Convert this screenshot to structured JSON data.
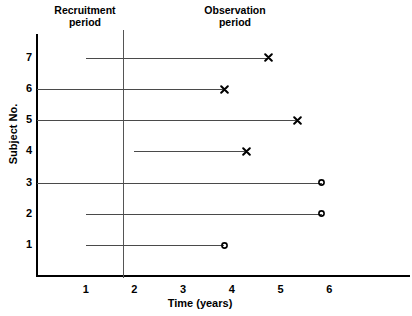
{
  "chart_data": {
    "type": "line",
    "title": "",
    "subtitle": "",
    "xlabel": "Time (years)",
    "ylabel": "Subject No.",
    "xlim": [
      0,
      7.6
    ],
    "ylim": [
      0,
      7.8
    ],
    "x_ticks": [
      "1",
      "2",
      "3",
      "4",
      "5",
      "6"
    ],
    "x_tick_values": [
      1,
      2,
      3,
      4,
      5,
      6
    ],
    "y_ticks": [
      "1",
      "2",
      "3",
      "4",
      "5",
      "6",
      "7"
    ],
    "y_tick_values": [
      1,
      2,
      3,
      4,
      5,
      6,
      7
    ],
    "grid": false,
    "legend": "none",
    "annotations": [
      {
        "name": "recruitment-period",
        "text": "Recruitment\nperiod",
        "x_range": [
          0,
          2
        ]
      },
      {
        "name": "observation-period",
        "text": "Observation\nperiod",
        "x_range": [
          2,
          6
        ]
      },
      {
        "name": "recruitment-observation-divider",
        "type": "vline",
        "x": 2
      }
    ],
    "marker_meaning": {
      "x": "event / failure",
      "o": "censored"
    },
    "series": [
      {
        "subject": 7,
        "start": 1.0,
        "end": 4.75,
        "marker": "x"
      },
      {
        "subject": 6,
        "start": 0.0,
        "end": 3.85,
        "marker": "x"
      },
      {
        "subject": 5,
        "start": 0.0,
        "end": 5.35,
        "marker": "x"
      },
      {
        "subject": 4,
        "start": 2.0,
        "end": 4.3,
        "marker": "x"
      },
      {
        "subject": 3,
        "start": 0.0,
        "end": 5.85,
        "marker": "o"
      },
      {
        "subject": 2,
        "start": 1.0,
        "end": 5.85,
        "marker": "o"
      },
      {
        "subject": 1,
        "start": 1.0,
        "end": 3.85,
        "marker": "o"
      }
    ]
  },
  "labels": {
    "recruitment_period": "Recruitment\nperiod",
    "observation_period": "Observation\nperiod",
    "x_axis_title": "Time (years)",
    "y_axis_title": "Subject No."
  },
  "colors": {
    "axis": "#000000",
    "line": "#4a4a4a",
    "divider": "#555555",
    "text": "#000000",
    "background": "#ffffff"
  }
}
